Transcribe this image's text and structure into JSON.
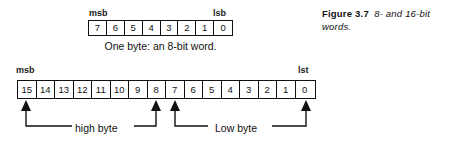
{
  "figure": {
    "number": "Figure 3.7",
    "description": "8- and 16-bit words.",
    "ink_color": "#111111",
    "paper_color": "#ffffff"
  },
  "byte8": {
    "msb_label": "msb",
    "lsb_label": "lsb",
    "caption": "One byte: an 8-bit word.",
    "cells": [
      "7",
      "6",
      "5",
      "4",
      "3",
      "2",
      "1",
      "0"
    ]
  },
  "word16": {
    "msb_label": "msb",
    "lsb_label": "lst",
    "cells": [
      "15",
      "14",
      "13",
      "12",
      "11",
      "10",
      "9",
      "8",
      "7",
      "6",
      "5",
      "4",
      "3",
      "2",
      "1",
      "0"
    ],
    "groups": [
      {
        "name": "high-byte",
        "label": "high byte",
        "bits": [
          "15",
          "8"
        ]
      },
      {
        "name": "low-byte",
        "label": "Low byte",
        "bits": [
          "7",
          "0"
        ]
      }
    ]
  }
}
